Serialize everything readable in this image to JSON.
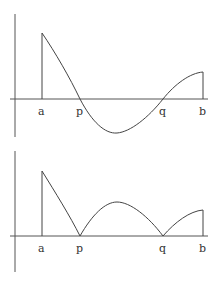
{
  "figure": {
    "colors": {
      "axis": "#555555",
      "curve": "#444444",
      "label": "#333333",
      "background": "#ffffff"
    }
  },
  "top_graph": {
    "name": "f(x)",
    "x_labels": {
      "a": "a",
      "p": "p",
      "q": "q",
      "b": "b"
    }
  },
  "bottom_graph": {
    "name": "|f(x)|",
    "x_labels": {
      "a": "a",
      "p": "p",
      "q": "q",
      "b": "b"
    }
  }
}
